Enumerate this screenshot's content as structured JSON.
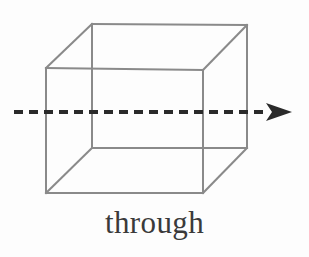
{
  "figure": {
    "caption": "through",
    "caption_color": "#3a3a3a",
    "background_color": "#fdfdfd",
    "cube": {
      "name": "wireframe-cube",
      "edge_color": "#8a8a8a",
      "edge_width": 2,
      "front_face": [
        [
          46,
          68
        ],
        [
          203,
          70
        ],
        [
          203,
          193
        ],
        [
          46,
          193
        ]
      ],
      "back_face": [
        [
          92,
          24
        ],
        [
          247,
          25
        ],
        [
          247,
          148
        ],
        [
          92,
          148
        ]
      ],
      "connectors": [
        [
          [
            46,
            68
          ],
          [
            92,
            24
          ]
        ],
        [
          [
            203,
            70
          ],
          [
            247,
            25
          ]
        ],
        [
          [
            203,
            193
          ],
          [
            247,
            148
          ]
        ],
        [
          [
            46,
            193
          ],
          [
            92,
            148
          ]
        ]
      ]
    },
    "arrow": {
      "name": "dashed-through-arrow",
      "color": "#2a2a2a",
      "line_width": 4,
      "dash_pattern": "9 6",
      "start": [
        14,
        112
      ],
      "end": [
        268,
        112
      ],
      "tip": [
        292,
        112
      ],
      "head_half_height": 8
    }
  }
}
